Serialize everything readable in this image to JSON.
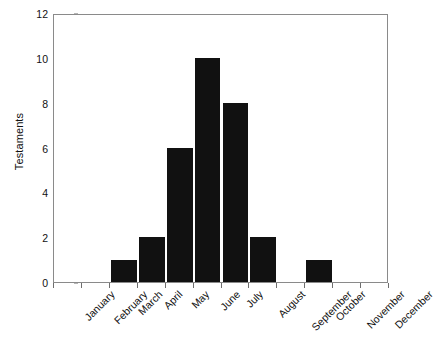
{
  "chart_data": {
    "type": "bar",
    "title": "",
    "subtitle": "",
    "xlabel": "",
    "ylabel": "Testaments",
    "categories": [
      "January",
      "February",
      "March",
      "April",
      "May",
      "June",
      "July",
      "August",
      "September",
      "October",
      "November",
      "December"
    ],
    "values": [
      0,
      0,
      1,
      2,
      6,
      10,
      8,
      2,
      0,
      1,
      0,
      0
    ],
    "ylim": [
      0,
      12
    ],
    "yticks": [
      0,
      2,
      4,
      6,
      8,
      10,
      12
    ],
    "ytick_labels": [
      "0",
      "2",
      "4",
      "6",
      "8",
      "10",
      "12"
    ],
    "grid": false,
    "legend": false,
    "legend_position": "none",
    "bar_color": "#111111",
    "axis_color": "#8a8a8a",
    "background_color": "#ffffff",
    "xtick_label_rotation": 45
  }
}
